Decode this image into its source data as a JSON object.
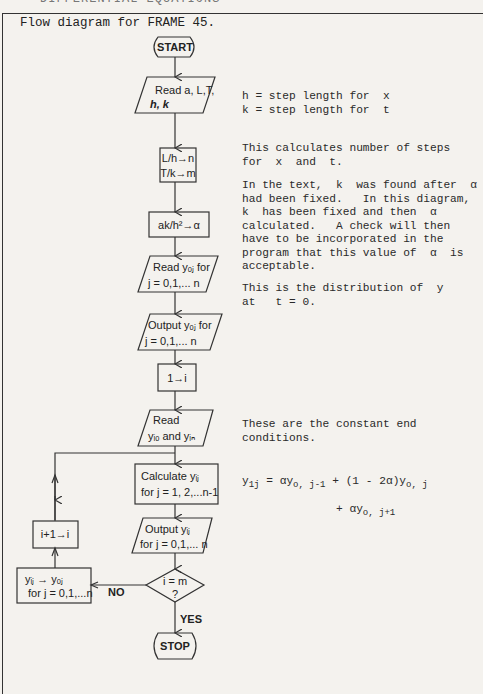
{
  "page": {
    "running_head": "DIFFERENTIAL EQUATIONS",
    "frame_title": "Flow diagram for FRAME 45."
  },
  "flowchart": {
    "start": "START",
    "read_inputs": {
      "line1": "Read a, L,T,",
      "line2": "h, k"
    },
    "compute_steps": {
      "line1": "L/h→n",
      "line2": "T/k→m"
    },
    "compute_alpha": "ak/h²→α",
    "read_y0": {
      "line1": "Read yₒⱼ for",
      "line2": "j = 0,1,... n"
    },
    "output_y0": {
      "line1": "Output yₒⱼ for",
      "line2": "j = 0,1,... n"
    },
    "init_i": "1→i",
    "read_ends": {
      "line1": "Read",
      "line2": "yᵢₒ and yᵢₙ"
    },
    "calculate": {
      "line1": "Calculate yᵢⱼ",
      "line2": "for j = 1, 2,...n-1"
    },
    "output_yij": {
      "line1": "Output yᵢⱼ",
      "line2": "for j = 0,1,... n"
    },
    "decision": {
      "line1": "i = m",
      "line2": "?"
    },
    "no_label": "NO",
    "yes_label": "YES",
    "copy_back": {
      "line1": "yᵢⱼ → yₒⱼ",
      "line2": "for j = 0,1,...n"
    },
    "increment": "i+1→i",
    "stop": "STOP"
  },
  "notes": {
    "step_lengths": "h = step length for  x\nk = step length for  t",
    "num_steps": "This calculates number of steps\nfor  x  and  t.",
    "alpha_note": "In the text,  k  was found after  α\nhad been fixed.   In this diagram,\nk  has been fixed and then  α\ncalculated.   A check will then\nhave to be incorporated in the\nprogram that this value of  α  is\nacceptable.",
    "distribution": "This is the distribution of  y\nat   t = 0.",
    "end_conditions": "These are the constant end\nconditions."
  },
  "equation": {
    "lhs": "y",
    "lhs_sub": "1j",
    "eq1": " = αy",
    "sub1": "o, j-1",
    "eq2": " + (1 - 2α)y",
    "sub2": "o, j",
    "eq3": "+ αy",
    "sub3": "o, j+1"
  }
}
